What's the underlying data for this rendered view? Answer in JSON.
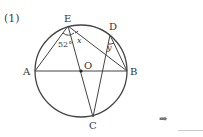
{
  "problem": {
    "number": "(1)"
  },
  "figure": {
    "points": {
      "A": "A",
      "B": "B",
      "C": "C",
      "D": "D",
      "E": "E",
      "O": "O"
    },
    "angles": {
      "given": "52°",
      "x": "x",
      "y": "y"
    }
  },
  "answer": {
    "arrow_icon": "➡",
    "value": ""
  }
}
